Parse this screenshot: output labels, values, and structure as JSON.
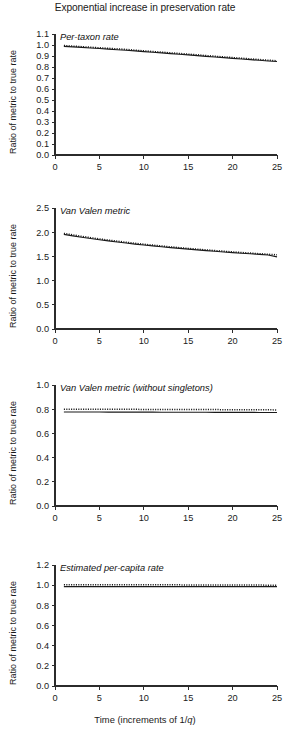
{
  "figure": {
    "title": "Exponential increase in preservation rate",
    "y_axis_label": "Ratio of metric to true rate",
    "x_axis_label_prefix": "Time (increments of 1/",
    "x_axis_label_italic": "q",
    "x_axis_label_suffix": ")"
  },
  "chart_data": [
    {
      "type": "line",
      "title": "Per-taxon rate",
      "panel_index": 1,
      "xlabel": "Time (increments of 1/q)",
      "ylabel": "Ratio of metric to true rate",
      "xlim": [
        0,
        25
      ],
      "ylim": [
        0.0,
        1.1
      ],
      "xticks": [
        0,
        5,
        10,
        15,
        20,
        25
      ],
      "yticks": [
        0.0,
        0.1,
        0.2,
        0.3,
        0.4,
        0.5,
        0.6,
        0.7,
        0.8,
        0.9,
        1.0,
        1.1
      ],
      "ytick_labels": [
        "0.0",
        "0.1",
        "0.2",
        "0.3",
        "0.4",
        "0.5",
        "0.6",
        "0.7",
        "0.8",
        "0.9",
        "1.0",
        "1.1"
      ],
      "grid": false,
      "legend": "none",
      "series": [
        {
          "name": "per-taxon rate (markers)",
          "style": "dotted",
          "x": [
            1,
            2,
            3,
            4,
            5,
            6,
            7,
            8,
            9,
            10,
            11,
            12,
            13,
            14,
            15,
            16,
            17,
            18,
            19,
            20,
            21,
            22,
            23,
            24,
            25
          ],
          "values": [
            0.995,
            0.99,
            0.985,
            0.98,
            0.975,
            0.97,
            0.965,
            0.96,
            0.953,
            0.947,
            0.941,
            0.935,
            0.929,
            0.923,
            0.917,
            0.911,
            0.904,
            0.898,
            0.892,
            0.886,
            0.88,
            0.874,
            0.868,
            0.862,
            0.857
          ]
        },
        {
          "name": "per-taxon rate (line)",
          "style": "solid",
          "x": [
            1,
            2,
            3,
            4,
            5,
            6,
            7,
            8,
            9,
            10,
            11,
            12,
            13,
            14,
            15,
            16,
            17,
            18,
            19,
            20,
            21,
            22,
            23,
            24,
            25
          ],
          "values": [
            0.988,
            0.983,
            0.978,
            0.973,
            0.968,
            0.963,
            0.957,
            0.952,
            0.946,
            0.94,
            0.934,
            0.928,
            0.922,
            0.916,
            0.91,
            0.904,
            0.897,
            0.891,
            0.885,
            0.879,
            0.873,
            0.867,
            0.861,
            0.855,
            0.85
          ]
        }
      ]
    },
    {
      "type": "line",
      "title": "Van Valen metric",
      "panel_index": 2,
      "xlabel": "Time (increments of 1/q)",
      "ylabel": "Ratio of metric to true rate",
      "xlim": [
        0,
        25
      ],
      "ylim": [
        0.0,
        2.5
      ],
      "xticks": [
        0,
        5,
        10,
        15,
        20,
        25
      ],
      "yticks": [
        0.0,
        0.5,
        1.0,
        1.5,
        2.0,
        2.5
      ],
      "ytick_labels": [
        "0.0",
        "0.5",
        "1.0",
        "1.5",
        "2.0",
        "2.5"
      ],
      "grid": false,
      "legend": "none",
      "series": [
        {
          "name": "Van Valen metric (markers)",
          "style": "dotted",
          "x": [
            1,
            2,
            3,
            4,
            5,
            6,
            7,
            8,
            9,
            10,
            11,
            12,
            13,
            14,
            15,
            16,
            17,
            18,
            19,
            20,
            21,
            22,
            23,
            24,
            25
          ],
          "values": [
            1.975,
            1.945,
            1.915,
            1.888,
            1.862,
            1.838,
            1.815,
            1.793,
            1.772,
            1.752,
            1.733,
            1.715,
            1.698,
            1.681,
            1.665,
            1.65,
            1.635,
            1.621,
            1.607,
            1.594,
            1.581,
            1.568,
            1.556,
            1.544,
            1.533
          ]
        },
        {
          "name": "Van Valen metric (line)",
          "style": "solid",
          "x": [
            1,
            2,
            3,
            4,
            5,
            6,
            7,
            8,
            9,
            10,
            11,
            12,
            13,
            14,
            15,
            16,
            17,
            18,
            19,
            20,
            21,
            22,
            23,
            24,
            25
          ],
          "values": [
            1.955,
            1.925,
            1.896,
            1.869,
            1.844,
            1.82,
            1.797,
            1.776,
            1.755,
            1.736,
            1.717,
            1.699,
            1.682,
            1.666,
            1.65,
            1.635,
            1.62,
            1.606,
            1.592,
            1.579,
            1.566,
            1.554,
            1.542,
            1.53,
            1.49
          ]
        }
      ]
    },
    {
      "type": "line",
      "title": "Van Valen metric (without singletons)",
      "panel_index": 3,
      "xlabel": "Time (increments of 1/q)",
      "ylabel": "Ratio of metric to true rate",
      "xlim": [
        0,
        25
      ],
      "ylim": [
        0.0,
        1.0
      ],
      "xticks": [
        0,
        5,
        10,
        15,
        20,
        25
      ],
      "yticks": [
        0.0,
        0.2,
        0.4,
        0.6,
        0.8,
        1.0
      ],
      "ytick_labels": [
        "0.0",
        "0.2",
        "0.4",
        "0.6",
        "0.8",
        "1.0"
      ],
      "grid": false,
      "legend": "none",
      "series": [
        {
          "name": "Van Valen without singletons (markers)",
          "style": "dotted",
          "x": [
            1,
            2,
            3,
            4,
            5,
            6,
            7,
            8,
            9,
            10,
            11,
            12,
            13,
            14,
            15,
            16,
            17,
            18,
            19,
            20,
            21,
            22,
            23,
            24,
            25
          ],
          "values": [
            0.8,
            0.8,
            0.8,
            0.8,
            0.799,
            0.799,
            0.799,
            0.799,
            0.799,
            0.798,
            0.798,
            0.798,
            0.798,
            0.798,
            0.797,
            0.797,
            0.797,
            0.797,
            0.796,
            0.796,
            0.796,
            0.795,
            0.795,
            0.795,
            0.794
          ]
        },
        {
          "name": "Van Valen without singletons (line)",
          "style": "solid",
          "x": [
            1,
            2,
            3,
            4,
            5,
            6,
            7,
            8,
            9,
            10,
            11,
            12,
            13,
            14,
            15,
            16,
            17,
            18,
            19,
            20,
            21,
            22,
            23,
            24,
            25
          ],
          "values": [
            0.777,
            0.777,
            0.777,
            0.777,
            0.777,
            0.776,
            0.776,
            0.776,
            0.776,
            0.776,
            0.776,
            0.775,
            0.775,
            0.775,
            0.775,
            0.775,
            0.775,
            0.774,
            0.774,
            0.774,
            0.774,
            0.774,
            0.773,
            0.773,
            0.773
          ]
        }
      ]
    },
    {
      "type": "line",
      "title": "Estimated per-capita rate",
      "panel_index": 4,
      "xlabel": "Time (increments of 1/q)",
      "ylabel": "Ratio of metric to true rate",
      "xlim": [
        0,
        25
      ],
      "ylim": [
        0.0,
        1.2
      ],
      "xticks": [
        0,
        5,
        10,
        15,
        20,
        25
      ],
      "yticks": [
        0.0,
        0.2,
        0.4,
        0.6,
        0.8,
        1.0,
        1.2
      ],
      "ytick_labels": [
        "0.0",
        "0.2",
        "0.4",
        "0.6",
        "0.8",
        "1.0",
        "1.2"
      ],
      "grid": false,
      "legend": "none",
      "series": [
        {
          "name": "estimated per-capita rate (markers)",
          "style": "dotted",
          "x": [
            1,
            2,
            3,
            4,
            5,
            6,
            7,
            8,
            9,
            10,
            11,
            12,
            13,
            14,
            15,
            16,
            17,
            18,
            19,
            20,
            21,
            22,
            23,
            24,
            25
          ],
          "values": [
            1.005,
            1.005,
            1.005,
            1.005,
            1.004,
            1.004,
            1.004,
            1.004,
            1.004,
            1.003,
            1.003,
            1.003,
            1.003,
            1.003,
            1.002,
            1.002,
            1.002,
            1.002,
            1.002,
            1.001,
            1.001,
            1.001,
            1.001,
            1.0,
            1.0
          ]
        },
        {
          "name": "estimated per-capita rate (line)",
          "style": "solid",
          "x": [
            1,
            2,
            3,
            4,
            5,
            6,
            7,
            8,
            9,
            10,
            11,
            12,
            13,
            14,
            15,
            16,
            17,
            18,
            19,
            20,
            21,
            22,
            23,
            24,
            25
          ],
          "values": [
            0.985,
            0.985,
            0.985,
            0.985,
            0.985,
            0.985,
            0.985,
            0.985,
            0.985,
            0.985,
            0.985,
            0.985,
            0.985,
            0.985,
            0.985,
            0.985,
            0.985,
            0.985,
            0.985,
            0.985,
            0.985,
            0.985,
            0.985,
            0.985,
            0.985
          ]
        }
      ]
    }
  ]
}
